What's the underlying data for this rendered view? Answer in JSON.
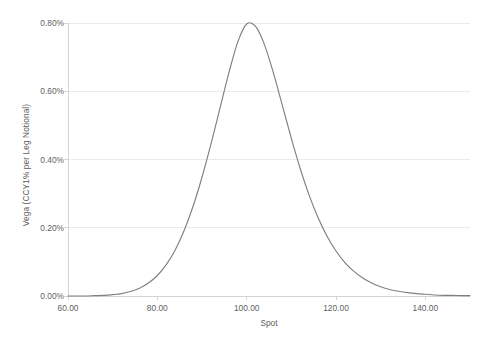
{
  "chart_data": {
    "type": "line",
    "title": "",
    "xlabel": "Spot",
    "ylabel": "Vega (CCY1% per Leg Notional)",
    "xlim": [
      60.0,
      150.0
    ],
    "ylim": [
      0.0,
      0.008
    ],
    "x_tick_labels": [
      "60.00",
      "80.00",
      "100.00",
      "120.00",
      "140.00"
    ],
    "x_tick_values": [
      60,
      80,
      100,
      120,
      140
    ],
    "y_tick_labels": [
      "0.00%",
      "0.20%",
      "0.40%",
      "0.60%",
      "0.80%"
    ],
    "y_tick_values": [
      0.0,
      0.002,
      0.004,
      0.006,
      0.008
    ],
    "grid": "horizontal",
    "legend": "none",
    "series": [
      {
        "name": "Vega",
        "color": "#808080",
        "x": [
          60,
          62,
          64,
          66,
          68,
          70,
          72,
          74,
          76,
          78,
          80,
          82,
          84,
          86,
          88,
          90,
          92,
          94,
          96,
          98,
          100,
          102,
          104,
          106,
          108,
          110,
          112,
          114,
          116,
          118,
          120,
          122,
          124,
          126,
          128,
          130,
          132,
          134,
          136,
          138,
          140,
          142,
          144,
          146,
          148,
          150
        ],
        "values": [
          0.0,
          0.0,
          0.0,
          1e-05,
          2e-05,
          4e-05,
          7e-05,
          0.00013,
          0.00023,
          0.00038,
          0.0006,
          0.00092,
          0.00135,
          0.00192,
          0.00263,
          0.00348,
          0.00445,
          0.00549,
          0.00653,
          0.00744,
          0.00797,
          0.0079,
          0.00736,
          0.00653,
          0.00558,
          0.00462,
          0.00373,
          0.00295,
          0.00229,
          0.00175,
          0.00132,
          0.00098,
          0.00072,
          0.00053,
          0.00038,
          0.00027,
          0.00019,
          0.00014,
          0.0001,
          7e-05,
          5e-05,
          3e-05,
          2e-05,
          2e-05,
          1e-05,
          1e-05
        ]
      }
    ],
    "peak": {
      "x": 100.0,
      "y": 0.00797,
      "y_label": "0.80%"
    }
  },
  "axis": {
    "axis_line_color": "#d9d9d9",
    "gridline_color": "#eaeaea",
    "tick_color": "#d9d9d9",
    "text_color": "#5f5f5f"
  },
  "caption": {
    "text": ""
  }
}
